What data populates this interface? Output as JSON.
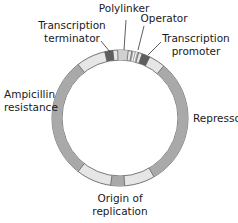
{
  "diagram": {
    "type": "plasmid-map",
    "colors": {
      "background": "#ffffff",
      "ring_base": "#e6e6e6",
      "ring_outline": "#555555",
      "medium_gray": "#a9a9a9",
      "dark_gray": "#5e5e5e",
      "light_band": "#d0d0d0",
      "text": "#1a1a1a"
    },
    "labels": {
      "polylinker": "Polylinker",
      "operator": "Operator",
      "terminator_line1": "Transcription",
      "terminator_line2": "terminator",
      "promoter_line1": "Transcription",
      "promoter_line2": "promoter",
      "ampicillin_line1": "Ampicillin",
      "ampicillin_line2": "resistance",
      "repressor": "Repressor",
      "origin_line1": "Origin of",
      "origin_line2": "replication"
    },
    "segments": [
      {
        "name": "Transcription terminator",
        "start_deg": -13,
        "end_deg": -6
      },
      {
        "name": "Polylinker",
        "start_deg": -2,
        "end_deg": 7
      },
      {
        "name": "Operator",
        "start_deg": 10,
        "end_deg": 16
      },
      {
        "name": "Transcription promoter",
        "start_deg": 19,
        "end_deg": 26
      },
      {
        "name": "Repressor",
        "start_deg": 40,
        "end_deg": 150
      },
      {
        "name": "Origin of replication",
        "start_deg": 176,
        "end_deg": 188
      },
      {
        "name": "Ampicillin resistance",
        "start_deg": 218,
        "end_deg": 322
      }
    ]
  }
}
